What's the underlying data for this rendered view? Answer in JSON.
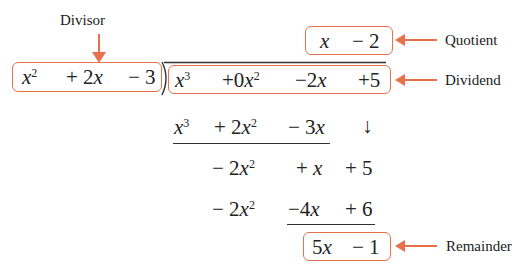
{
  "labels": {
    "divisor": "Divisor",
    "quotient": "Quotient",
    "dividend": "Dividend",
    "remainder": "Remainder"
  },
  "divisor_terms": [
    {
      "coef": "",
      "var": "x",
      "exp": "2"
    },
    {
      "coef": "+ 2",
      "var": "x",
      "exp": ""
    },
    {
      "coef": "− 3",
      "var": "",
      "exp": ""
    }
  ],
  "dividend_terms": [
    {
      "coef": "",
      "var": "x",
      "exp": "3"
    },
    {
      "coef": "+0",
      "var": "x",
      "exp": "2"
    },
    {
      "coef": "−2",
      "var": "x",
      "exp": ""
    },
    {
      "coef": "+5",
      "var": "",
      "exp": ""
    }
  ],
  "quotient_terms": [
    {
      "coef": "",
      "var": "x",
      "exp": ""
    },
    {
      "coef": "− 2",
      "var": "",
      "exp": ""
    }
  ],
  "steps": [
    {
      "terms": [
        {
          "coef": "",
          "var": "x",
          "exp": "3"
        },
        {
          "coef": "+ 2",
          "var": "x",
          "exp": "2"
        },
        {
          "coef": "− 3",
          "var": "x",
          "exp": ""
        },
        {
          "coef": "↓",
          "var": "",
          "exp": ""
        }
      ]
    },
    {
      "terms": [
        {
          "coef": "− 2",
          "var": "x",
          "exp": "2"
        },
        {
          "coef": "+ ",
          "var": "x",
          "exp": ""
        },
        {
          "coef": "+ 5",
          "var": "",
          "exp": ""
        }
      ]
    },
    {
      "terms": [
        {
          "coef": "− 2",
          "var": "x",
          "exp": "2"
        },
        {
          "coef": "−4",
          "var": "x",
          "exp": ""
        },
        {
          "coef": "+ 6",
          "var": "",
          "exp": ""
        }
      ]
    }
  ],
  "remainder_terms": [
    {
      "coef": "5",
      "var": "x",
      "exp": ""
    },
    {
      "coef": "− 1",
      "var": "",
      "exp": ""
    }
  ],
  "colors": {
    "highlight": "#e8704a",
    "text": "#222222"
  }
}
